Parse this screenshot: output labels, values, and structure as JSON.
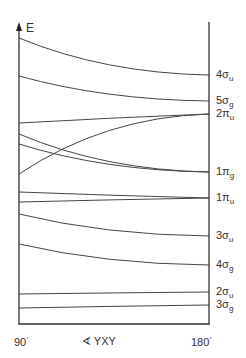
{
  "diagram": {
    "type": "walsh_diagram",
    "y_axis_label": "E",
    "x_axis_label": "∢ YXY",
    "x_left_label": "90",
    "x_right_label": "180",
    "degree_symbol": "°",
    "orbitals_right": [
      {
        "num": "4",
        "sym": "σ",
        "sub": "u",
        "y": 75
      },
      {
        "num": "5",
        "sym": "σ",
        "sub": "g",
        "y": 101
      },
      {
        "num": "2",
        "sym": "π",
        "sub": "u",
        "y": 114
      },
      {
        "num": "1",
        "sym": "π",
        "sub": "g",
        "y": 172
      },
      {
        "num": "1",
        "sym": "π",
        "sub": "u",
        "y": 198
      },
      {
        "num": "3",
        "sym": "σ",
        "sub": "u",
        "y": 236
      },
      {
        "num": "4",
        "sym": "σ",
        "sub": "g",
        "y": 265
      },
      {
        "num": "2",
        "sym": "σ",
        "sub": "u",
        "y": 292
      },
      {
        "num": "3",
        "sym": "σ",
        "sub": "g",
        "y": 305
      }
    ],
    "curves": [
      {
        "from_y": 38,
        "to_y": 75,
        "shape": "concave"
      },
      {
        "from_y": 76,
        "to_y": 101,
        "shape": "concave"
      },
      {
        "from_y": 123,
        "to_y": 114,
        "shape": "flat"
      },
      {
        "from_y": 134,
        "to_y": 172,
        "shape": "concave"
      },
      {
        "from_y": 144,
        "to_y": 172,
        "shape": "concave"
      },
      {
        "from_y": 174,
        "to_y": 114,
        "shape": "convex"
      },
      {
        "from_y": 192,
        "to_y": 198,
        "shape": "flat"
      },
      {
        "from_y": 202,
        "to_y": 198,
        "shape": "flat"
      },
      {
        "from_y": 214,
        "to_y": 236,
        "shape": "concave"
      },
      {
        "from_y": 244,
        "to_y": 265,
        "shape": "concave"
      },
      {
        "from_y": 294,
        "to_y": 292,
        "shape": "flat"
      },
      {
        "from_y": 308,
        "to_y": 305,
        "shape": "flat"
      }
    ]
  }
}
